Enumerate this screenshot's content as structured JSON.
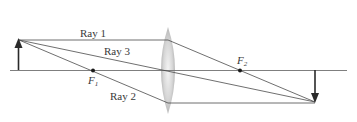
{
  "diagram": {
    "type": "converging-lens-ray-diagram",
    "colors": {
      "ray": "#4a4a4a",
      "axis": "#6a6a6a",
      "arrow": "#2a2a2a",
      "lens_light": "#f2f2f2",
      "lens_dark": "#b8b8b8"
    },
    "labels": {
      "ray1": "Ray 1",
      "ray2": "Ray 2",
      "ray3": "Ray 3",
      "f1_main": "F",
      "f1_sub": "1",
      "f2_main": "F",
      "f2_sub": "2"
    },
    "elements": {
      "object": "upright object arrow left of lens",
      "lens": "biconvex converging lens",
      "image": "inverted real image arrow right of F2",
      "focal_points": [
        "F1",
        "F2"
      ]
    }
  }
}
